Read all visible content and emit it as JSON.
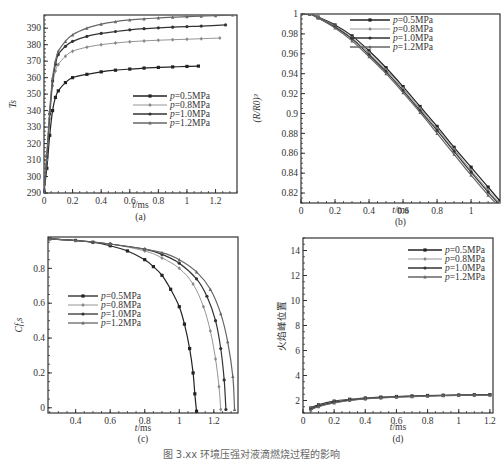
{
  "figure": {
    "caption": "图 3.xx  环境压强对液滴燃烧过程的影响"
  },
  "legend_labels": [
    "p=0.5MPa",
    "p=0.8MPa",
    "p=1.0MPa",
    "p=1.2MPa"
  ],
  "series_colors": [
    "#222222",
    "#888888",
    "#333333",
    "#666666"
  ],
  "chart_data": [
    {
      "id": "a",
      "type": "line",
      "panel_label": "(a)",
      "title": "",
      "xlabel": "t/ms",
      "ylabel": "T_s",
      "xlim": [
        0,
        1.35
      ],
      "ylim": [
        290,
        398
      ],
      "xticks": [
        0,
        0.2,
        0.4,
        0.6,
        0.8,
        1,
        1.2
      ],
      "xtick_labels": [
        "0",
        "0.2",
        "0.4",
        "0.6",
        "0.8",
        "1",
        "1.2"
      ],
      "yticks": [
        290,
        300,
        310,
        320,
        330,
        340,
        350,
        360,
        370,
        380,
        390
      ],
      "ytick_labels": [
        "290",
        "300",
        "310",
        "320",
        "330",
        "340",
        "350",
        "360",
        "370",
        "380",
        "390"
      ],
      "grid": false,
      "legend_position": "center-right",
      "series": [
        {
          "name": "p=0.5MPa",
          "x": [
            0,
            0.02,
            0.04,
            0.06,
            0.08,
            0.1,
            0.15,
            0.2,
            0.3,
            0.4,
            0.5,
            0.6,
            0.7,
            0.8,
            0.9,
            1.0,
            1.08
          ],
          "y": [
            291,
            305,
            325,
            340,
            348,
            352,
            357,
            360,
            362,
            363.5,
            364.5,
            365.2,
            365.8,
            366.2,
            366.5,
            366.8,
            367
          ]
        },
        {
          "name": "p=0.8MPa",
          "x": [
            0,
            0.02,
            0.04,
            0.06,
            0.08,
            0.1,
            0.15,
            0.2,
            0.3,
            0.4,
            0.5,
            0.6,
            0.7,
            0.8,
            0.9,
            1.0,
            1.1,
            1.23
          ],
          "y": [
            291,
            310,
            335,
            355,
            364,
            368,
            373,
            376,
            378.5,
            380,
            381,
            381.8,
            382.3,
            382.7,
            383,
            383.3,
            383.6,
            384
          ]
        },
        {
          "name": "p=1.0MPa",
          "x": [
            0,
            0.02,
            0.04,
            0.06,
            0.08,
            0.1,
            0.15,
            0.2,
            0.3,
            0.4,
            0.5,
            0.6,
            0.7,
            0.8,
            0.9,
            1.0,
            1.1,
            1.27
          ],
          "y": [
            291,
            312,
            338,
            358,
            368,
            374,
            379,
            382,
            385,
            386.8,
            388,
            389,
            389.7,
            390.2,
            390.6,
            391,
            391.3,
            392
          ]
        },
        {
          "name": "p=1.2MPa",
          "x": [
            0,
            0.02,
            0.04,
            0.06,
            0.08,
            0.1,
            0.15,
            0.2,
            0.3,
            0.4,
            0.5,
            0.6,
            0.7,
            0.8,
            0.9,
            1.0,
            1.1,
            1.2,
            1.32
          ],
          "y": [
            291,
            314,
            340,
            360,
            370,
            376,
            382,
            386,
            390,
            392.5,
            394,
            395,
            395.7,
            396.2,
            396.7,
            397,
            397.3,
            397.6,
            398
          ]
        }
      ]
    },
    {
      "id": "b",
      "type": "line",
      "panel_label": "(b)",
      "title": "",
      "xlabel": "t/ms",
      "ylabel": "(R/R_0)^3",
      "xlim": [
        0,
        1.17
      ],
      "ylim": [
        0.81,
        1.0
      ],
      "xticks": [
        0,
        0.2,
        0.4,
        0.6,
        0.8,
        1
      ],
      "xtick_labels": [
        "0",
        "0.2",
        "0.4",
        "0.6",
        "0.8",
        "1"
      ],
      "yticks": [
        0.82,
        0.84,
        0.86,
        0.88,
        0.9,
        0.92,
        0.94,
        0.96,
        0.98,
        1
      ],
      "ytick_labels": [
        "0.82",
        "0.84",
        "0.86",
        "0.88",
        "0.9",
        "0.92",
        "0.94",
        "0.96",
        "0.98",
        "1"
      ],
      "grid": false,
      "legend_position": "upper-right",
      "series": [
        {
          "name": "p=0.5MPa",
          "x": [
            0,
            0.05,
            0.1,
            0.2,
            0.3,
            0.4,
            0.5,
            0.6,
            0.7,
            0.8,
            0.9,
            1.0,
            1.1,
            1.17
          ],
          "y": [
            1.0,
            1.0,
            0.997,
            0.989,
            0.978,
            0.963,
            0.946,
            0.927,
            0.907,
            0.887,
            0.866,
            0.846,
            0.826,
            0.812
          ]
        },
        {
          "name": "p=0.8MPa",
          "x": [
            0,
            0.05,
            0.1,
            0.2,
            0.3,
            0.4,
            0.5,
            0.6,
            0.7,
            0.8,
            0.9,
            1.0,
            1.1,
            1.17
          ],
          "y": [
            1.0,
            1.0,
            0.997,
            0.988,
            0.976,
            0.961,
            0.944,
            0.925,
            0.905,
            0.885,
            0.864,
            0.843,
            0.823,
            0.81
          ]
        },
        {
          "name": "p=1.0MPa",
          "x": [
            0,
            0.05,
            0.1,
            0.2,
            0.3,
            0.4,
            0.5,
            0.6,
            0.7,
            0.8,
            0.9,
            1.0,
            1.1,
            1.17
          ],
          "y": [
            1.0,
            1.0,
            0.996,
            0.987,
            0.975,
            0.959,
            0.942,
            0.923,
            0.903,
            0.883,
            0.862,
            0.841,
            0.821,
            0.808
          ]
        },
        {
          "name": "p=1.2MPa",
          "x": [
            0,
            0.05,
            0.1,
            0.2,
            0.3,
            0.4,
            0.5,
            0.6,
            0.7,
            0.8,
            0.9,
            1.0,
            1.1,
            1.17
          ],
          "y": [
            1.0,
            1.0,
            0.996,
            0.986,
            0.973,
            0.957,
            0.94,
            0.921,
            0.901,
            0.88,
            0.859,
            0.838,
            0.818,
            0.806
          ]
        }
      ]
    },
    {
      "id": "c",
      "type": "line",
      "panel_label": "(c)",
      "title": "",
      "xlabel": "t/ms",
      "ylabel": "C_{f,s}",
      "xlim": [
        0.24,
        1.34
      ],
      "ylim": [
        -0.03,
        0.98
      ],
      "xticks": [
        0.4,
        0.6,
        0.8,
        1,
        1.2
      ],
      "xtick_labels": [
        "0.4",
        "0.6",
        "0.8",
        "1",
        "1.2"
      ],
      "yticks": [
        0,
        0.2,
        0.4,
        0.6,
        0.8
      ],
      "ytick_labels": [
        "0",
        "0.2",
        "0.4",
        "0.6",
        "0.8"
      ],
      "grid": false,
      "legend_position": "center-left",
      "series": [
        {
          "name": "p=0.5MPa",
          "x": [
            0.25,
            0.4,
            0.5,
            0.6,
            0.7,
            0.8,
            0.85,
            0.9,
            0.95,
            1.0,
            1.03,
            1.06,
            1.08,
            1.09,
            1.1
          ],
          "y": [
            0.97,
            0.96,
            0.95,
            0.93,
            0.9,
            0.85,
            0.81,
            0.76,
            0.68,
            0.58,
            0.48,
            0.34,
            0.2,
            0.08,
            -0.02
          ]
        },
        {
          "name": "p=0.8MPa",
          "x": [
            0.25,
            0.4,
            0.6,
            0.8,
            0.9,
            1.0,
            1.08,
            1.14,
            1.18,
            1.21,
            1.23,
            1.24
          ],
          "y": [
            0.97,
            0.96,
            0.94,
            0.9,
            0.86,
            0.8,
            0.71,
            0.58,
            0.44,
            0.28,
            0.12,
            -0.01
          ]
        },
        {
          "name": "p=1.0MPa",
          "x": [
            0.25,
            0.4,
            0.6,
            0.8,
            0.9,
            1.0,
            1.1,
            1.16,
            1.21,
            1.24,
            1.26,
            1.27
          ],
          "y": [
            0.97,
            0.96,
            0.94,
            0.91,
            0.88,
            0.83,
            0.74,
            0.64,
            0.5,
            0.34,
            0.16,
            -0.01
          ]
        },
        {
          "name": "p=1.2MPa",
          "x": [
            0.25,
            0.4,
            0.6,
            0.8,
            0.9,
            1.0,
            1.1,
            1.18,
            1.24,
            1.28,
            1.31,
            1.32
          ],
          "y": [
            0.97,
            0.96,
            0.94,
            0.91,
            0.89,
            0.85,
            0.78,
            0.68,
            0.54,
            0.38,
            0.18,
            -0.01
          ]
        }
      ]
    },
    {
      "id": "d",
      "type": "line",
      "panel_label": "(d)",
      "title": "",
      "xlabel": "t/ms",
      "ylabel": "火焰峰位置",
      "xlim": [
        0,
        1.22
      ],
      "ylim": [
        1,
        15
      ],
      "xticks": [
        0,
        0.2,
        0.4,
        0.6,
        0.8,
        1,
        1.2
      ],
      "xtick_labels": [
        "0",
        "0.2",
        "0.4",
        "0.6",
        "0.8",
        "1",
        "1.2"
      ],
      "yticks": [
        2,
        4,
        6,
        8,
        10,
        12,
        14
      ],
      "ytick_labels": [
        "2",
        "4",
        "6",
        "8",
        "10",
        "12",
        "14"
      ],
      "grid": false,
      "legend_position": "upper-right",
      "series": [
        {
          "name": "p=0.5MPa",
          "x": [
            0.05,
            0.1,
            0.2,
            0.3,
            0.4,
            0.5,
            0.6,
            0.7,
            0.8,
            0.9,
            1.0,
            1.1,
            1.2
          ],
          "y": [
            1.4,
            1.65,
            1.95,
            2.1,
            2.2,
            2.27,
            2.32,
            2.36,
            2.4,
            2.42,
            2.44,
            2.46,
            2.47
          ]
        },
        {
          "name": "p=0.8MPa",
          "x": [
            0.05,
            0.1,
            0.2,
            0.3,
            0.4,
            0.5,
            0.6,
            0.7,
            0.8,
            0.9,
            1.0,
            1.1,
            1.2
          ],
          "y": [
            1.35,
            1.6,
            1.9,
            2.07,
            2.17,
            2.25,
            2.3,
            2.35,
            2.38,
            2.41,
            2.43,
            2.45,
            2.46
          ]
        },
        {
          "name": "p=1.0MPa",
          "x": [
            0.05,
            0.1,
            0.2,
            0.3,
            0.4,
            0.5,
            0.6,
            0.7,
            0.8,
            0.9,
            1.0,
            1.1,
            1.2
          ],
          "y": [
            1.3,
            1.55,
            1.85,
            2.03,
            2.14,
            2.22,
            2.28,
            2.33,
            2.37,
            2.4,
            2.42,
            2.44,
            2.45
          ]
        },
        {
          "name": "p=1.2MPa",
          "x": [
            0.05,
            0.1,
            0.2,
            0.3,
            0.4,
            0.5,
            0.6,
            0.7,
            0.8,
            0.9,
            1.0,
            1.1,
            1.2
          ],
          "y": [
            1.25,
            1.5,
            1.8,
            2.0,
            2.12,
            2.2,
            2.26,
            2.31,
            2.35,
            2.38,
            2.41,
            2.43,
            2.44
          ]
        }
      ]
    }
  ]
}
